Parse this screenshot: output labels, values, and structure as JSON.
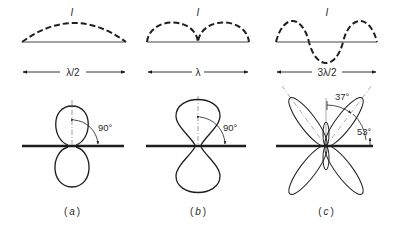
{
  "figure": {
    "panels": [
      {
        "id": "a",
        "current_label": "I",
        "length_label": "λ/2",
        "angle_label": "90°",
        "caption_open": "(",
        "caption_letter": "a",
        "caption_close": ")"
      },
      {
        "id": "b",
        "current_label": "I",
        "length_label": "λ",
        "angle_label": "90°",
        "caption_open": "(",
        "caption_letter": "b",
        "caption_close": ")"
      },
      {
        "id": "c",
        "current_label": "I",
        "length_label": "3λ/2",
        "angle_label_top": "37°",
        "angle_label_side": "53°",
        "caption_open": "(",
        "caption_letter": "c",
        "caption_close": ")"
      }
    ],
    "colors": {
      "ink": "#1e1e1e",
      "guide": "#777777",
      "background": "#ffffff"
    }
  }
}
